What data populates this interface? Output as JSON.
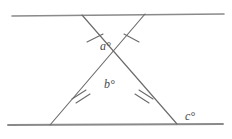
{
  "figure": {
    "type": "geometry-diagram",
    "background_color": "#ffffff",
    "stroke_color": "#6b6b6b",
    "parallel_line_color": "#8a8a8a",
    "label_color": "#4a4a4a"
  },
  "labels": {
    "angle_a": "a°",
    "angle_b": "b°",
    "angle_c": "c°"
  },
  "geometry": {
    "top_line": {
      "x1": 12,
      "y1": 16,
      "x2": 224,
      "y2": 14
    },
    "bottom_line": {
      "x1": 8,
      "y1": 125,
      "x2": 223,
      "y2": 124
    },
    "transversal_left": {
      "x1": 82,
      "y1": 15,
      "x2": 177,
      "y2": 124
    },
    "transversal_right": {
      "x1": 145,
      "y1": 14,
      "x2": 50,
      "y2": 125
    },
    "crossing_point": {
      "x": 113,
      "y": 66
    },
    "tick_marks": {
      "upper_left": {
        "count": 1,
        "x": 95,
        "y": 38
      },
      "upper_right": {
        "count": 1,
        "x": 131,
        "y": 38
      },
      "lower_left": {
        "count": 2,
        "x": 79,
        "y": 95
      },
      "lower_right": {
        "count": 2,
        "x": 146,
        "y": 95
      }
    }
  }
}
